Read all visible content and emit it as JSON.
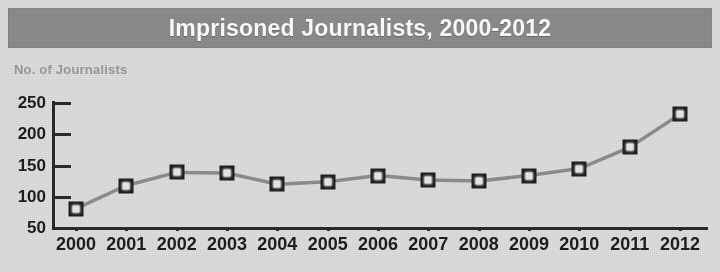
{
  "title": "Imprisoned Journalists, 2000-2012",
  "axis": {
    "y_label": "No. of Journalists",
    "y_ticks": [
      250,
      200,
      150,
      100,
      50
    ]
  },
  "colors": {
    "title_bar": "#8c8c8c",
    "title_text": "#ffffff",
    "background": "#dedede",
    "axis": "#2a2a2a",
    "line": "#8e8e8e",
    "marker_border": "#1e1e1e",
    "marker_fill": "#e9e9e9",
    "y_label_text": "#9a9a9a"
  },
  "chart_data": {
    "type": "line",
    "title": "Imprisoned Journalists, 2000-2012",
    "xlabel": "",
    "ylabel": "No. of Journalists",
    "categories": [
      "2000",
      "2001",
      "2002",
      "2003",
      "2004",
      "2005",
      "2006",
      "2007",
      "2008",
      "2009",
      "2010",
      "2011",
      "2012"
    ],
    "values": [
      81,
      118,
      139,
      138,
      120,
      124,
      134,
      127,
      125,
      134,
      145,
      179,
      232
    ],
    "ylim": [
      50,
      250
    ],
    "yticks": [
      50,
      100,
      150,
      200,
      250
    ],
    "grid": false,
    "legend": "none",
    "marker": "square"
  }
}
